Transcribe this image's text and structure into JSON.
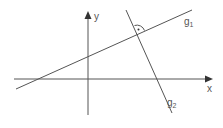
{
  "diagram": {
    "axes": {
      "x_label": "x",
      "y_label": "y"
    },
    "lines": [
      {
        "name": "g",
        "subscript": "1"
      },
      {
        "name": "g",
        "subscript": "2"
      }
    ],
    "right_angle_marker": "perpendicular at intersection of g1 and g2",
    "colors": {
      "stroke": "#555555",
      "background": "#ffffff"
    }
  }
}
